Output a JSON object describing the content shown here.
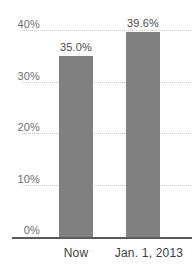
{
  "chart_data": {
    "type": "bar",
    "title": "",
    "subtitle": "",
    "xlabel": "",
    "ylabel": "",
    "categories": [
      "Now",
      "Jan. 1, 2013"
    ],
    "values": [
      35.0,
      39.6
    ],
    "value_labels": [
      "35.0%",
      "39.6%"
    ],
    "ylim": [
      0,
      40
    ],
    "ytick_values": [
      40,
      30,
      20,
      10,
      0
    ],
    "ytick_labels": [
      "40%",
      "30%",
      "20%",
      "10%",
      "0%"
    ],
    "grid": true,
    "grid_style": "dotted",
    "legend": false,
    "legend_position": "none",
    "series": [
      {
        "name": "",
        "values": [
          35.0,
          39.6
        ],
        "color": "#808080"
      }
    ],
    "colors": {
      "bar": "#808080",
      "gridline": "#c9c9c9",
      "axis": "#5a5a5a",
      "ytick_text": "#6d6d6d",
      "xtick_text": "#3d3d3d",
      "value_text": "#4a4a4a",
      "background": "#ffffff"
    }
  }
}
